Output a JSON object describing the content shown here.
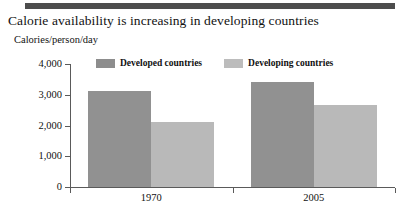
{
  "chart_data": {
    "type": "bar",
    "title": "Calorie availability is increasing in developing countries",
    "subtitle": "Calories/person/day",
    "xlabel": "",
    "ylabel": "Calories/person/day",
    "categories": [
      "1970",
      "2005"
    ],
    "series": [
      {
        "name": "Developed countries",
        "color": "#919191",
        "values": [
          3120,
          3420
        ]
      },
      {
        "name": "Developing countries",
        "color": "#b9b9b9",
        "values": [
          2110,
          2680
        ]
      }
    ],
    "ylim": [
      0,
      4000
    ],
    "yticks": [
      0,
      1000,
      2000,
      3000,
      4000
    ],
    "ytick_labels": [
      "0",
      "1,000",
      "2,000",
      "3,000",
      "4,000"
    ],
    "grid": false,
    "legend_position": "top-center"
  },
  "decor": {
    "top_rule_color": "#4d4d4d",
    "axis_color": "#5a5a5a",
    "background": "#ffffff"
  }
}
